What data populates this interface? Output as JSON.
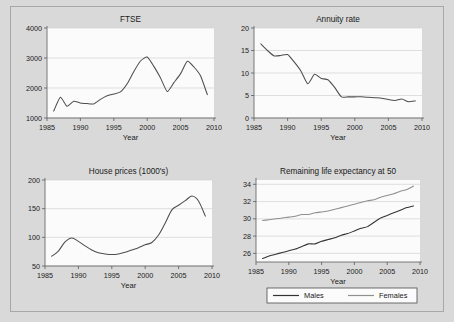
{
  "figure": {
    "background": "#d9d9d9",
    "plot_background": "#fbfbfb",
    "panels": [
      "FTSE",
      "Annuity rate",
      "House prices (1000's)",
      "Remaining life expectancy at 50"
    ]
  },
  "chart_data": [
    {
      "id": "ftse",
      "type": "line",
      "title": "FTSE",
      "xlabel": "Year",
      "ylabel": "",
      "xlim": [
        1985,
        2010
      ],
      "ylim": [
        1000,
        4000
      ],
      "xticks": [
        1985,
        1990,
        1995,
        2000,
        2005,
        2010
      ],
      "yticks": [
        1000,
        2000,
        3000,
        4000
      ],
      "grid": true,
      "legend": "none",
      "color": "#4d4d4d",
      "x": [
        1986,
        1987,
        1988,
        1989,
        1990,
        1991,
        1992,
        1993,
        1994,
        1995,
        1996,
        1997,
        1998,
        1999,
        2000,
        2001,
        2002,
        2003,
        2004,
        2005,
        2006,
        2007,
        2008,
        2009
      ],
      "values": [
        1230,
        1690,
        1390,
        1560,
        1500,
        1480,
        1470,
        1620,
        1740,
        1800,
        1870,
        2140,
        2550,
        2900,
        3030,
        2720,
        2330,
        1880,
        2180,
        2480,
        2890,
        2700,
        2400,
        1780
      ]
    },
    {
      "id": "annuity",
      "type": "line",
      "title": "Annuity rate",
      "xlabel": "Year",
      "ylabel": "",
      "xlim": [
        1985,
        2010
      ],
      "ylim": [
        0,
        20
      ],
      "xticks": [
        1985,
        1990,
        1995,
        2000,
        2005,
        2010
      ],
      "yticks": [
        0,
        5,
        10,
        15,
        20
      ],
      "grid": true,
      "legend": "none",
      "color": "#4d4d4d",
      "x": [
        1986,
        1987,
        1988,
        1989,
        1990,
        1991,
        1992,
        1993,
        1994,
        1995,
        1996,
        1997,
        1998,
        1999,
        2000,
        2001,
        2002,
        2003,
        2004,
        2005,
        2006,
        2007,
        2008,
        2009
      ],
      "values": [
        16.5,
        15.0,
        13.8,
        13.9,
        14.1,
        12.4,
        10.4,
        7.6,
        9.7,
        8.8,
        8.5,
        6.8,
        4.7,
        4.7,
        4.7,
        4.7,
        4.6,
        4.5,
        4.4,
        4.1,
        3.9,
        4.2,
        3.6,
        3.8
      ]
    },
    {
      "id": "house",
      "type": "line",
      "title": "House prices (1000's)",
      "xlabel": "Year",
      "ylabel": "",
      "xlim": [
        1985,
        2010
      ],
      "ylim": [
        50,
        200
      ],
      "xticks": [
        1985,
        1990,
        1995,
        2000,
        2005,
        2010
      ],
      "yticks": [
        50,
        100,
        150,
        200
      ],
      "grid": true,
      "legend": "none",
      "color": "#4d4d4d",
      "x": [
        1986,
        1987,
        1988,
        1989,
        1990,
        1991,
        1992,
        1993,
        1994,
        1995,
        1996,
        1997,
        1998,
        1999,
        2000,
        2001,
        2002,
        2003,
        2004,
        2005,
        2006,
        2007,
        2008,
        2009
      ],
      "values": [
        67,
        76,
        92,
        99,
        93,
        85,
        78,
        73,
        71,
        70,
        71,
        74,
        78,
        82,
        87,
        91,
        104,
        125,
        148,
        156,
        164,
        172,
        163,
        137
      ]
    },
    {
      "id": "life",
      "type": "line",
      "title": "Remaining life expectancy at 50",
      "xlabel": "Year",
      "ylabel": "",
      "xlim": [
        1985,
        2010
      ],
      "ylim": [
        25,
        34.5
      ],
      "xticks": [
        1985,
        1990,
        1995,
        2000,
        2005,
        2010
      ],
      "yticks": [
        26,
        28,
        30,
        32,
        34
      ],
      "grid": true,
      "legend": "bottom",
      "x": [
        1986,
        1987,
        1988,
        1989,
        1990,
        1991,
        1992,
        1993,
        1994,
        1995,
        1996,
        1997,
        1998,
        1999,
        2000,
        2001,
        2002,
        2003,
        2004,
        2005,
        2006,
        2007,
        2008,
        2009
      ],
      "series": [
        {
          "name": "Males",
          "color": "#333333",
          "values": [
            25.4,
            25.7,
            25.9,
            26.1,
            26.3,
            26.5,
            26.8,
            27.1,
            27.1,
            27.4,
            27.6,
            27.8,
            28.1,
            28.3,
            28.6,
            28.9,
            29.1,
            29.6,
            30.1,
            30.4,
            30.7,
            31.0,
            31.3,
            31.5
          ],
          "legend_label": "Males"
        },
        {
          "name": "Females",
          "color": "#8f8f8f",
          "values": [
            29.8,
            29.9,
            30.0,
            30.1,
            30.2,
            30.3,
            30.5,
            30.5,
            30.7,
            30.8,
            30.9,
            31.1,
            31.3,
            31.5,
            31.7,
            31.9,
            32.1,
            32.2,
            32.5,
            32.7,
            32.9,
            33.2,
            33.4,
            33.8
          ],
          "legend_label": "Females"
        }
      ]
    }
  ]
}
